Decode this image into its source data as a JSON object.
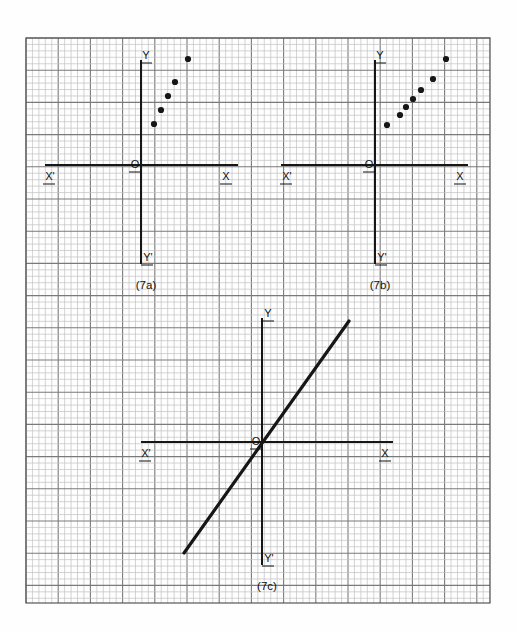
{
  "figure": {
    "title": "",
    "background_color": "#fefefe",
    "grid": {
      "x": 26,
      "y": 38,
      "width": 464,
      "height": 565,
      "minor_cell_px": 6.44,
      "major_every": 5,
      "minor_color": "#c2c2c2",
      "major_color": "#7a7a7a",
      "border_color": "#555555"
    },
    "ink_color": "#161616"
  },
  "chart_data": [
    {
      "type": "scatter",
      "id": "panel-7a",
      "caption": "(7a)",
      "title": "",
      "xlabel": "",
      "ylabel": "",
      "grid": true,
      "legend": "none",
      "axes": {
        "origin_label": "O",
        "x_positive_label": "X",
        "x_negative_label": "X'",
        "y_positive_label": "Y",
        "y_negative_label": "Y'",
        "origin_px": [
          141,
          165
        ],
        "x_axis_from_px": [
          45,
          165
        ],
        "x_axis_to_px": [
          238,
          165
        ],
        "y_axis_from_px": [
          141,
          60
        ],
        "y_axis_to_px": [
          141,
          264
        ]
      },
      "points_px": [
        [
          154,
          124
        ],
        [
          161,
          110
        ],
        [
          168,
          96
        ],
        [
          175,
          82
        ],
        [
          188,
          59
        ]
      ],
      "x": [
        2,
        3,
        4,
        5,
        7
      ],
      "y": [
        6.4,
        8.5,
        10.7,
        12.9,
        16.5
      ],
      "note": "five dots rising steeply to the right of the Y-axis, concave/curved trend"
    },
    {
      "type": "scatter",
      "id": "panel-7b",
      "caption": "(7b)",
      "title": "",
      "xlabel": "",
      "ylabel": "",
      "grid": true,
      "legend": "none",
      "axes": {
        "origin_label": "O",
        "x_positive_label": "X",
        "x_negative_label": "X'",
        "y_positive_label": "Y",
        "y_negative_label": "Y'",
        "origin_px": [
          375,
          165
        ],
        "x_axis_from_px": [
          281,
          165
        ],
        "x_axis_to_px": [
          468,
          165
        ],
        "y_axis_from_px": [
          375,
          60
        ],
        "y_axis_to_px": [
          375,
          264
        ]
      },
      "points_px": [
        [
          387,
          125
        ],
        [
          400,
          115
        ],
        [
          406,
          107
        ],
        [
          413,
          99
        ],
        [
          421,
          90
        ],
        [
          433,
          79
        ],
        [
          446,
          59
        ]
      ],
      "x": [
        1.9,
        3.9,
        4.8,
        5.9,
        7.1,
        9.0,
        11.0
      ],
      "y": [
        6.2,
        7.8,
        9.0,
        10.2,
        11.6,
        13.4,
        16.5
      ],
      "note": "seven dots in a near-linear rising band to the right of the Y-axis"
    },
    {
      "type": "line",
      "id": "panel-7c",
      "caption": "(7c)",
      "title": "",
      "xlabel": "",
      "ylabel": "",
      "grid": true,
      "legend": "none",
      "axes": {
        "origin_label": "O",
        "x_positive_label": "X",
        "x_negative_label": "X'",
        "y_positive_label": "Y",
        "y_negative_label": "Y'",
        "origin_px": [
          262,
          442
        ],
        "x_axis_from_px": [
          141,
          442
        ],
        "x_axis_to_px": [
          393,
          442
        ],
        "y_axis_from_px": [
          262,
          318
        ],
        "y_axis_to_px": [
          262,
          565
        ]
      },
      "line_px": {
        "from": [
          184,
          553
        ],
        "to": [
          349,
          321
        ]
      },
      "x": [
        -12.1,
        13.5
      ],
      "y": [
        -17.2,
        18.8
      ],
      "slope": -1.41,
      "note": "single straight line through the origin with positive slope, drawn thick"
    }
  ],
  "labels": {
    "origin": "O",
    "x_positive": "X",
    "x_negative": "X'",
    "y_positive": "Y",
    "y_negative": "Y'",
    "caption_a": "(7a)",
    "caption_b": "(7b)",
    "caption_c": "(7c)"
  }
}
